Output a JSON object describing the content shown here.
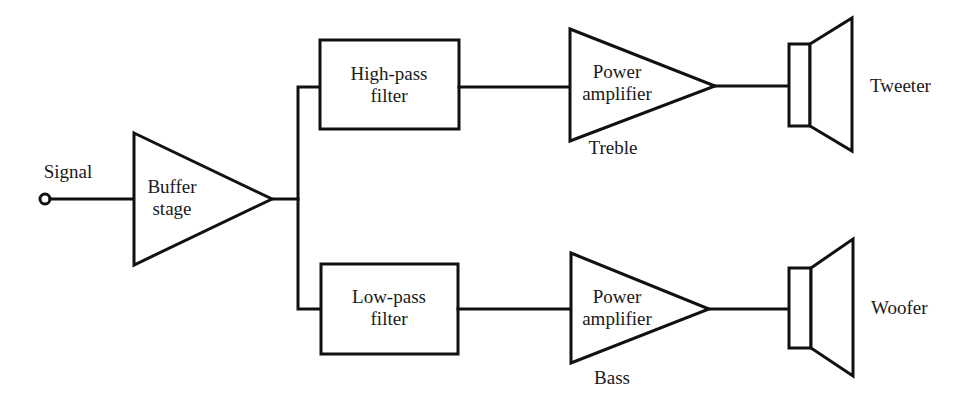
{
  "diagram": {
    "type": "block-diagram",
    "colors": {
      "line": "#111111",
      "background": "#ffffff",
      "text": "#1a1a1a"
    },
    "input": {
      "label": "Signal"
    },
    "buffer": {
      "line1": "Buffer",
      "line2": "stage"
    },
    "high_filter": {
      "line1": "High-pass",
      "line2": "filter"
    },
    "low_filter": {
      "line1": "Low-pass",
      "line2": "filter"
    },
    "treble_amp": {
      "line1": "Power",
      "line2": "amplifier",
      "caption": "Treble"
    },
    "bass_amp": {
      "line1": "Power",
      "line2": "amplifier",
      "caption": "Bass"
    },
    "tweeter": {
      "label": "Tweeter"
    },
    "woofer": {
      "label": "Woofer"
    },
    "nodes": [
      "Signal",
      "Buffer stage",
      "High-pass filter",
      "Low-pass filter",
      "Power amplifier (Treble)",
      "Power amplifier (Bass)",
      "Tweeter",
      "Woofer"
    ],
    "edges": [
      [
        "Signal",
        "Buffer stage"
      ],
      [
        "Buffer stage",
        "High-pass filter"
      ],
      [
        "Buffer stage",
        "Low-pass filter"
      ],
      [
        "High-pass filter",
        "Power amplifier (Treble)"
      ],
      [
        "Low-pass filter",
        "Power amplifier (Bass)"
      ],
      [
        "Power amplifier (Treble)",
        "Tweeter"
      ],
      [
        "Power amplifier (Bass)",
        "Woofer"
      ]
    ]
  }
}
